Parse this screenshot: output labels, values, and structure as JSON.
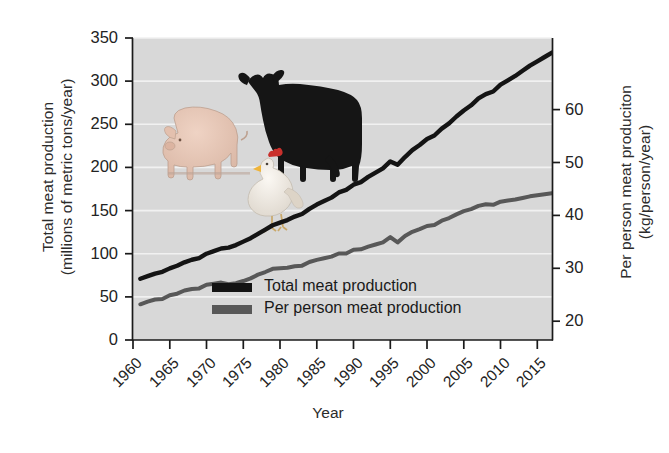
{
  "chart_data": {
    "type": "line",
    "title": "",
    "xlabel": "Year",
    "ylabel_left": "Total meat production\n(millions of metric tons/year)",
    "ylabel_left_line1": "Total meat production",
    "ylabel_left_line2": "(millions of metric tons/year)",
    "ylabel_right_line1": "Per person meat produciton",
    "ylabel_right_line2": "(kg/person/year)",
    "xlim": [
      1960,
      2017
    ],
    "ylim_left": [
      0,
      350
    ],
    "ylim_right": [
      16.45,
      73.53
    ],
    "grid": true,
    "legend_position": "inside-lower-center",
    "x_ticks": [
      1960,
      1965,
      1970,
      1975,
      1980,
      1985,
      1990,
      1995,
      2000,
      2005,
      2010,
      2015
    ],
    "y_ticks_left": [
      0,
      50,
      100,
      150,
      200,
      250,
      300,
      350
    ],
    "y_ticks_right": [
      20,
      30,
      40,
      50,
      60
    ],
    "plot_background": "#d8d8d8",
    "gridline_color": "#f0f0f0",
    "series": [
      {
        "name": "Total meat production",
        "color": "#141414",
        "unit": "millions of metric tons/year",
        "axis": "left",
        "x": [
          1961,
          1962,
          1963,
          1964,
          1965,
          1966,
          1967,
          1968,
          1969,
          1970,
          1971,
          1972,
          1973,
          1974,
          1975,
          1976,
          1977,
          1978,
          1979,
          1980,
          1981,
          1982,
          1983,
          1984,
          1985,
          1986,
          1987,
          1988,
          1989,
          1990,
          1991,
          1992,
          1993,
          1994,
          1995,
          1996,
          1997,
          1998,
          1999,
          2000,
          2001,
          2002,
          2003,
          2004,
          2005,
          2006,
          2007,
          2008,
          2009,
          2010,
          2011,
          2012,
          2013,
          2014,
          2015,
          2016,
          2017
        ],
        "values": [
          71,
          74,
          77,
          79,
          83,
          86,
          90,
          93,
          95,
          100,
          103,
          106,
          107,
          110,
          114,
          118,
          123,
          128,
          133,
          136,
          139,
          143,
          146,
          152,
          157,
          161,
          165,
          171,
          174,
          180,
          183,
          189,
          194,
          199,
          207,
          203,
          212,
          220,
          226,
          233,
          237,
          245,
          251,
          259,
          266,
          272,
          280,
          285,
          288,
          296,
          301,
          306,
          312,
          318,
          323,
          328,
          333
        ]
      },
      {
        "name": "Per person meat production",
        "color": "#585858",
        "unit": "kg/person/year",
        "axis": "right",
        "x": [
          1961,
          1962,
          1963,
          1964,
          1965,
          1966,
          1967,
          1968,
          1969,
          1970,
          1971,
          1972,
          1973,
          1974,
          1975,
          1976,
          1977,
          1978,
          1979,
          1980,
          1981,
          1982,
          1983,
          1984,
          1985,
          1986,
          1987,
          1988,
          1989,
          1990,
          1991,
          1992,
          1993,
          1994,
          1995,
          1996,
          1997,
          1998,
          1999,
          2000,
          2001,
          2002,
          2003,
          2004,
          2005,
          2006,
          2007,
          2008,
          2009,
          2010,
          2011,
          2012,
          2013,
          2014,
          2015,
          2016,
          2017
        ],
        "values": [
          23.2,
          23.7,
          24.1,
          24.2,
          24.9,
          25.2,
          25.8,
          26.1,
          26.2,
          26.9,
          27.1,
          27.3,
          27.0,
          27.2,
          27.6,
          28.1,
          28.8,
          29.3,
          29.9,
          30.0,
          30.1,
          30.4,
          30.5,
          31.2,
          31.6,
          31.9,
          32.2,
          32.8,
          32.8,
          33.5,
          33.6,
          34.1,
          34.5,
          34.9,
          35.9,
          34.9,
          36.1,
          36.9,
          37.4,
          38.0,
          38.2,
          39.0,
          39.5,
          40.2,
          40.8,
          41.2,
          41.8,
          42.1,
          42.0,
          42.6,
          42.8,
          43.0,
          43.3,
          43.6,
          43.8,
          44.0,
          44.2
        ]
      }
    ],
    "annotations": [
      {
        "name": "cow-illustration",
        "label": "cow"
      },
      {
        "name": "pig-illustration",
        "label": "pig"
      },
      {
        "name": "chicken-illustration",
        "label": "chicken"
      }
    ]
  },
  "legend": {
    "items": [
      {
        "label": "Total meat production",
        "color": "#141414"
      },
      {
        "label": "Per person meat production",
        "color": "#585858"
      }
    ]
  }
}
